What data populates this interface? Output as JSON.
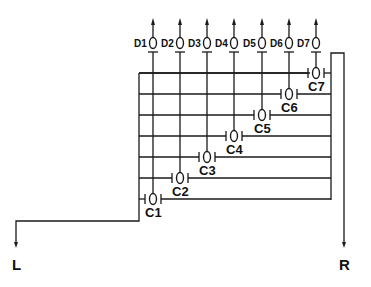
{
  "diagram": {
    "type": "transistor-array-schematic",
    "drains": [
      {
        "label": "D1",
        "x": 153
      },
      {
        "label": "D2",
        "x": 180
      },
      {
        "label": "D3",
        "x": 207
      },
      {
        "label": "D4",
        "x": 234
      },
      {
        "label": "D5",
        "x": 262
      },
      {
        "label": "D6",
        "x": 289
      },
      {
        "label": "D7",
        "x": 316
      }
    ],
    "cells": [
      {
        "label": "C1",
        "y": 199
      },
      {
        "label": "C2",
        "y": 178
      },
      {
        "label": "C3",
        "y": 157
      },
      {
        "label": "C4",
        "y": 136
      },
      {
        "label": "C5",
        "y": 115
      },
      {
        "label": "C6",
        "y": 94
      },
      {
        "label": "C7",
        "y": 73
      }
    ],
    "terminals": {
      "left": "L",
      "right": "R"
    },
    "colors": {
      "line": "#1a1a1a",
      "background": "#ffffff"
    }
  }
}
